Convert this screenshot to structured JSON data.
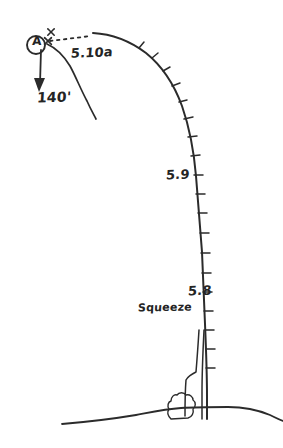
{
  "diagram": {
    "kind": "hand-drawn-climbing-route-topo",
    "paper_color": "#ffffff",
    "ink_color": "#2b2b2b"
  },
  "labels": {
    "anchor_letter": "A",
    "rappel_length": "140'",
    "grade_top_pitch": "5.10a",
    "grade_mid_pitch": "5.9",
    "grade_low_pitch": "5.8",
    "feature_note": "Squeeze"
  },
  "icons": {
    "anchor": "circled-letter-a-icon",
    "rappel_arrow": "down-arrow-icon",
    "bolt_upper": "bolt-x-icon",
    "bolt_lower": "bolt-x-icon",
    "bush": "bush-icon",
    "ground": "ground-line-icon",
    "approach": "dashed-traverse-icon"
  },
  "geometry": {
    "cliff_profile": "M 93 33 C 112 34 130 41 146 53 C 162 66 174 84 182 106 C 190 129 194 152 196 176 C 198 200 200 226 202 252 C 203 276 204 300 205 324 C 206 348 207 372 207 396 C 207 406 207 413 207 419",
    "face_line": "M 47 44 C 56 48 64 56 70 66 C 76 77 81 90 87 101 C 91 110 94 115 96 119",
    "dashed_traverse": "M 50 41 L 91 36",
    "crack_left": "M 199 330 C 198 346 197 360 196 372 C 192 374 188 376 186 380 C 185 392 185 404 185 416",
    "crack_right": "M 204 330 C 203 350 202 372 202 392 C 202 404 202 412 202 419",
    "ground_line": "M 62 424 C 86 422 112 419 136 415 C 152 412 166 409 181 408 C 196 407 212 407 228 407 C 244 407 258 410 270 415 C 276 418 280 420 283 421",
    "bush": "M 171 419 C 168 416 167 412 169 409 C 167 406 168 402 171 401 C 171 397 174 394 177 395 C 179 392 184 392 186 395 C 190 394 193 397 193 400 C 196 402 196 407 193 409 C 194 413 192 417 188 418 Z",
    "rappel_arrow_shaft": "M 41 50 L 40 84",
    "rappel_arrow_head": "39,92 34,78 45,78",
    "anchor_ring": {
      "cx": 36,
      "cy": 45,
      "r": 9
    },
    "bolts": [
      {
        "cx": 51,
        "cy": 32,
        "size": 3.2
      },
      {
        "cx": 48,
        "cy": 41,
        "size": 3.4
      }
    ],
    "ticks": [
      {
        "x": 139,
        "y": 48,
        "dx": 5,
        "dy": -6
      },
      {
        "x": 152,
        "y": 58,
        "dx": 6,
        "dy": -5
      },
      {
        "x": 163,
        "y": 71,
        "dx": 7,
        "dy": -4
      },
      {
        "x": 172,
        "y": 86,
        "dx": 8,
        "dy": -3
      },
      {
        "x": 179,
        "y": 102,
        "dx": 8,
        "dy": -2
      },
      {
        "x": 184,
        "y": 119,
        "dx": 9,
        "dy": -2
      },
      {
        "x": 188,
        "y": 137,
        "dx": 9,
        "dy": -1
      },
      {
        "x": 191,
        "y": 156,
        "dx": 9,
        "dy": -1
      },
      {
        "x": 194,
        "y": 175,
        "dx": 9,
        "dy": 0
      },
      {
        "x": 196,
        "y": 194,
        "dx": 9,
        "dy": 0
      },
      {
        "x": 198,
        "y": 213,
        "dx": 9,
        "dy": 0
      },
      {
        "x": 200,
        "y": 233,
        "dx": 9,
        "dy": 0
      },
      {
        "x": 201,
        "y": 253,
        "dx": 9,
        "dy": 0
      },
      {
        "x": 202,
        "y": 273,
        "dx": 9,
        "dy": 0
      },
      {
        "x": 203,
        "y": 292,
        "dx": 9,
        "dy": 0
      },
      {
        "x": 204,
        "y": 311,
        "dx": 9,
        "dy": 0
      },
      {
        "x": 205,
        "y": 330,
        "dx": 9,
        "dy": 0
      },
      {
        "x": 206,
        "y": 349,
        "dx": 9,
        "dy": 0
      },
      {
        "x": 206,
        "y": 368,
        "dx": 9,
        "dy": 0
      }
    ]
  }
}
